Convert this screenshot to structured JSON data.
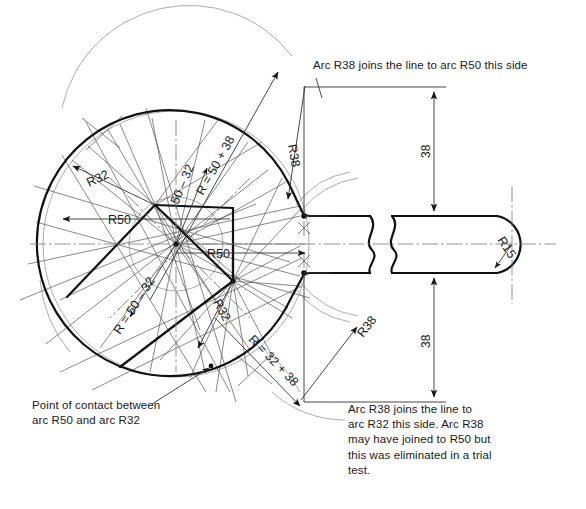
{
  "drawing": {
    "title": "Spanner head geometric construction",
    "background_color": "#ffffff",
    "ink_color": "#111111",
    "construction_color": "#555555"
  },
  "notes": {
    "top_right": "Arc R38 joins the line to arc R50 this side",
    "bottom_left": "Point of contact between\narc R50 and arc R32",
    "bottom_right": "Arc R38 joins the line to\narc R32 this side. Arc R38\nmay have joined to R50 but\nthis was eliminated in a trial\ntest."
  },
  "radius_labels": {
    "r50_plus_38": "R = 50 + 38",
    "r50_minus_32_top": "50 – 32",
    "r50_minus_32_left": "R = 50 – 32",
    "r32_plus_38": "R = 32 + 38",
    "r32_upper_left": "R32",
    "r32_lower": "R32",
    "r50_upper": "R50",
    "r50_lower": "R50",
    "r38_upper": "R38",
    "r38_lower": "R38",
    "r15": "R15"
  },
  "dimensions": {
    "upper_38": "38",
    "lower_38": "38"
  }
}
